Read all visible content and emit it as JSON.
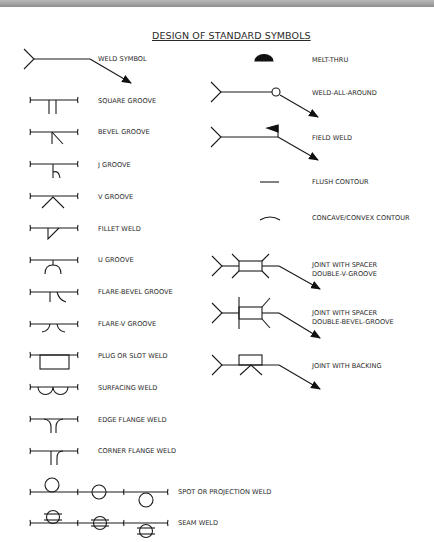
{
  "title": "DESIGN OF STANDARD SYMBOLS",
  "left_column": [
    {
      "id": "weld-symbol",
      "label": "WELD SYMBOL"
    },
    {
      "id": "square-groove",
      "label": "SQUARE GROOVE"
    },
    {
      "id": "bevel-groove",
      "label": "BEVEL GROOVE"
    },
    {
      "id": "j-groove",
      "label": "J GROOVE"
    },
    {
      "id": "v-groove",
      "label": "V GROOVE"
    },
    {
      "id": "fillet-weld",
      "label": "FILLET WELD"
    },
    {
      "id": "u-groove",
      "label": "U GROOVE"
    },
    {
      "id": "flare-bevel-groove",
      "label": "FLARE-BEVEL GROOVE"
    },
    {
      "id": "flare-v-groove",
      "label": "FLARE-V GROOVE"
    },
    {
      "id": "plug-or-slot-weld",
      "label": "PLUG OR SLOT WELD"
    },
    {
      "id": "surfacing-weld",
      "label": "SURFACING WELD"
    },
    {
      "id": "edge-flange-weld",
      "label": "EDGE FLANGE WELD"
    },
    {
      "id": "corner-flange-weld",
      "label": "CORNER FLANGE WELD"
    },
    {
      "id": "spot-or-projection-weld",
      "label": "SPOT OR PROJECTION WELD"
    },
    {
      "id": "seam-weld",
      "label": "SEAM WELD"
    }
  ],
  "right_column": [
    {
      "id": "melt-thru",
      "label": "MELT-THRU"
    },
    {
      "id": "weld-all-around",
      "label": "WELD-ALL-AROUND"
    },
    {
      "id": "field-weld",
      "label": "FIELD WELD"
    },
    {
      "id": "flush-contour",
      "label": "FLUSH CONTOUR"
    },
    {
      "id": "concave-convex-contour",
      "label": "CONCAVE/CONVEX CONTOUR"
    },
    {
      "id": "joint-spacer-double-v",
      "label_line1": "JOINT WITH SPACER",
      "label_line2": "DOUBLE-V-GROOVE"
    },
    {
      "id": "joint-spacer-double-bevel",
      "label_line1": "JOINT WITH SPACER",
      "label_line2": "DOUBLE-BEVEL-GROOVE"
    },
    {
      "id": "joint-with-backing",
      "label": "JOINT WITH BACKING"
    }
  ]
}
